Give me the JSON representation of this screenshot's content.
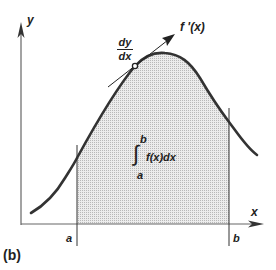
{
  "figure": {
    "panel_label": "(b)",
    "axes": {
      "x_label": "x",
      "y_label": "y"
    },
    "bounds": {
      "lower": "a",
      "upper": "b"
    },
    "derivative": {
      "numerator": "dy",
      "denominator": "dx",
      "tangent_label": "f '(x)"
    },
    "integral": {
      "upper": "b",
      "lower": "a",
      "integrand": "f(x)dx",
      "symbol": "∫"
    },
    "colors": {
      "curve": "#333333",
      "shade": "#d9d9d9",
      "axis": "#555555"
    }
  }
}
